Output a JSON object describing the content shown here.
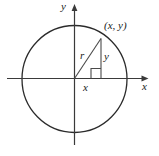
{
  "figure": {
    "background_color": "#ffffff",
    "stroke_color": "#2b2b2b",
    "axes": {
      "x_axis_label": "x",
      "y_axis_label": "y",
      "origin": {
        "x": 74.5,
        "y": 78.5
      },
      "x_axis_start": {
        "x": 7,
        "y": 78.5
      },
      "x_axis_end": {
        "x": 148,
        "y": 78.5
      },
      "y_axis_start": {
        "x": 74.5,
        "y": 145
      },
      "y_axis_end": {
        "x": 74.5,
        "y": 5
      },
      "arrowheads": [
        "x-positive",
        "y-positive"
      ]
    },
    "circle": {
      "center_x": 74.5,
      "center_y": 79,
      "radius_x": 52.5,
      "radius_y": 53.5
    },
    "point": {
      "label": "(x, y)",
      "px": 101,
      "py": 38
    },
    "segments": {
      "radius": {
        "label": "r",
        "from": "origin",
        "to": "point"
      },
      "vertical": {
        "label": "y",
        "from": "foot",
        "to": "point"
      },
      "horizontal": {
        "label": "x",
        "from": "origin",
        "to": "foot"
      }
    },
    "right_angle_marker": {
      "present": true,
      "corner_x": 101,
      "corner_y": 78.5,
      "size": 10
    }
  }
}
